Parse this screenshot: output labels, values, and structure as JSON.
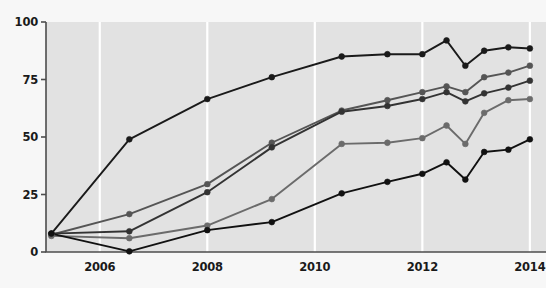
{
  "chart_data": {
    "type": "line",
    "title": "",
    "subtitle": "",
    "xlabel": "",
    "ylabel": "",
    "xlim": [
      2005.0,
      2014.3
    ],
    "ylim": [
      0,
      100
    ],
    "grid": true,
    "grid_orientation": "vertical",
    "legend": "none",
    "xtick_labels": [
      "2006",
      "2008",
      "2010",
      "2012",
      "2014"
    ],
    "xtick_values": [
      2006,
      2008,
      2010,
      2012,
      2014
    ],
    "ytick_labels": [
      "0",
      "25",
      "50",
      "75",
      "100"
    ],
    "ytick_values": [
      0,
      25,
      50,
      75,
      100
    ],
    "plot_bg": "#e2e2e2",
    "page_bg": "#f7f7f7",
    "grid_color": "#ffffff",
    "axis_color": "#4d4d4d",
    "series": [
      {
        "name": "series-1",
        "color": "#1a1a1a",
        "x": [
          2005.1,
          2006.55,
          2008.0,
          2009.2,
          2010.5,
          2011.35,
          2012.0,
          2012.45,
          2012.8,
          2013.15,
          2013.6,
          2014.0
        ],
        "values": [
          8.0,
          49.0,
          66.5,
          76.0,
          85.0,
          86.0,
          86.0,
          92.0,
          81.0,
          87.5,
          89.0,
          88.5
        ]
      },
      {
        "name": "series-2",
        "color": "#555555",
        "x": [
          2005.1,
          2006.55,
          2008.0,
          2009.2,
          2010.5,
          2011.35,
          2012.0,
          2012.45,
          2012.8,
          2013.15,
          2013.6,
          2014.0
        ],
        "values": [
          7.5,
          16.5,
          29.5,
          47.5,
          61.5,
          66.0,
          69.5,
          72.0,
          69.5,
          76.0,
          78.0,
          81.0
        ]
      },
      {
        "name": "series-3",
        "color": "#333333",
        "x": [
          2005.1,
          2006.55,
          2008.0,
          2009.2,
          2010.5,
          2011.35,
          2012.0,
          2012.45,
          2012.8,
          2013.15,
          2013.6,
          2014.0
        ],
        "values": [
          8.0,
          9.0,
          26.0,
          45.5,
          61.0,
          63.5,
          66.5,
          69.5,
          65.5,
          69.0,
          71.5,
          74.5
        ]
      },
      {
        "name": "series-4",
        "color": "#6b6b6b",
        "x": [
          2005.1,
          2006.55,
          2008.0,
          2009.2,
          2010.5,
          2011.35,
          2012.0,
          2012.45,
          2012.8,
          2013.15,
          2013.6,
          2014.0
        ],
        "values": [
          7.0,
          6.0,
          11.5,
          23.0,
          47.0,
          47.5,
          49.5,
          55.0,
          47.0,
          60.5,
          66.0,
          66.5
        ]
      },
      {
        "name": "series-5",
        "color": "#111111",
        "x": [
          2005.1,
          2006.55,
          2008.0,
          2009.2,
          2010.5,
          2011.35,
          2012.0,
          2012.45,
          2012.8,
          2013.15,
          2013.6,
          2014.0
        ],
        "values": [
          8.0,
          0.3,
          9.5,
          13.0,
          25.5,
          30.5,
          34.0,
          39.0,
          31.5,
          43.5,
          44.5,
          49.0
        ]
      }
    ]
  },
  "axes": {
    "y_labels": [
      "100",
      "75",
      "50",
      "25",
      "0"
    ],
    "x_labels": [
      "2006",
      "2008",
      "2010",
      "2012",
      "2014"
    ]
  }
}
